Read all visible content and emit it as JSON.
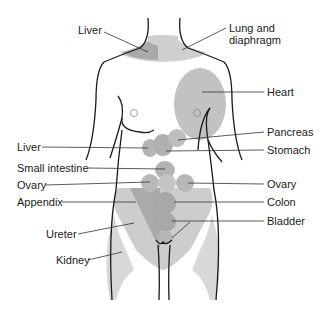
{
  "diagram": {
    "type": "anatomical referred-pain map",
    "colors": {
      "outline": "#1a1a1a",
      "region_light": "#d9d9d9",
      "region_mid": "#bdbdbd",
      "region_dark": "#a6a6a6",
      "leader_line": "#333333",
      "text": "#1a1a1a"
    },
    "labels_left": [
      {
        "id": "liver-top",
        "text": "Liver"
      },
      {
        "id": "liver-mid",
        "text": "Liver"
      },
      {
        "id": "small-intestine",
        "text": "Small intestine"
      },
      {
        "id": "ovary-left",
        "text": "Ovary"
      },
      {
        "id": "appendix",
        "text": "Appendix"
      },
      {
        "id": "ureter",
        "text": "Ureter"
      },
      {
        "id": "kidney",
        "text": "Kidney"
      }
    ],
    "labels_right": [
      {
        "id": "lung-diaphragm",
        "text": "Lung and diaphragm",
        "lines": [
          "Lung and",
          "diaphragm"
        ]
      },
      {
        "id": "heart",
        "text": "Heart"
      },
      {
        "id": "pancreas",
        "text": "Pancreas"
      },
      {
        "id": "stomach",
        "text": "Stomach"
      },
      {
        "id": "ovary-right",
        "text": "Ovary"
      },
      {
        "id": "colon",
        "text": "Colon"
      },
      {
        "id": "bladder",
        "text": "Bladder"
      }
    ]
  }
}
